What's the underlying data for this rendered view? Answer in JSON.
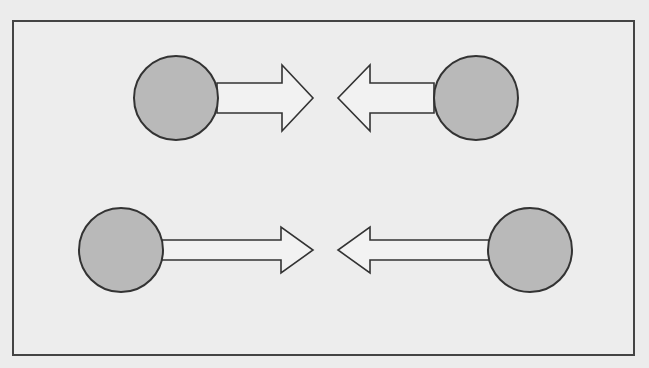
{
  "diagram": {
    "background": "#ececec",
    "frame": {
      "x": 13,
      "y": 21,
      "w": 621,
      "h": 334,
      "stroke": "#444444",
      "fill": "#ededed"
    },
    "circle_fill": "#b9b9b9",
    "stroke": "#333333",
    "arrow_fill": "#f2f2f2",
    "rows": [
      {
        "name": "top-row",
        "y": 98,
        "left": {
          "circle_cx": 176,
          "r": 42,
          "shaft_start": 217,
          "head_base": 282,
          "tip": 313
        },
        "right": {
          "circle_cx": 476,
          "r": 42,
          "shaft_start": 434,
          "head_base": 370,
          "tip": 338
        },
        "shaft_half": 15,
        "head_half": 33
      },
      {
        "name": "bottom-row",
        "y": 250,
        "left": {
          "circle_cx": 121,
          "r": 42,
          "shaft_start": 162,
          "head_base": 281,
          "tip": 313
        },
        "right": {
          "circle_cx": 530,
          "r": 42,
          "shaft_start": 489,
          "head_base": 370,
          "tip": 338
        },
        "shaft_half": 10,
        "head_half": 23
      }
    ]
  }
}
